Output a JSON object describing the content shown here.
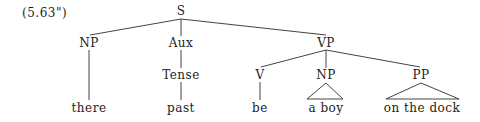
{
  "example_number": "(5.63\")",
  "tree": {
    "root": {
      "label": "S"
    },
    "level1": [
      {
        "label": "NP"
      },
      {
        "label": "Aux"
      },
      {
        "label": "VP"
      }
    ],
    "level2": [
      {
        "label": "Tense",
        "parent": "Aux"
      },
      {
        "label": "V",
        "parent": "VP"
      },
      {
        "label": "NP",
        "parent": "VP"
      },
      {
        "label": "PP",
        "parent": "VP"
      }
    ],
    "leaves": [
      {
        "text": "there",
        "parent": "NP"
      },
      {
        "text": "past",
        "parent": "Tense"
      },
      {
        "text": "be",
        "parent": "V"
      },
      {
        "text": "a boy",
        "parent": "NP",
        "triangle": true
      },
      {
        "text": "on the dock",
        "parent": "PP",
        "triangle": true
      }
    ]
  },
  "colors": {
    "line": "#444444",
    "text": "#222222",
    "background": "#ffffff"
  }
}
